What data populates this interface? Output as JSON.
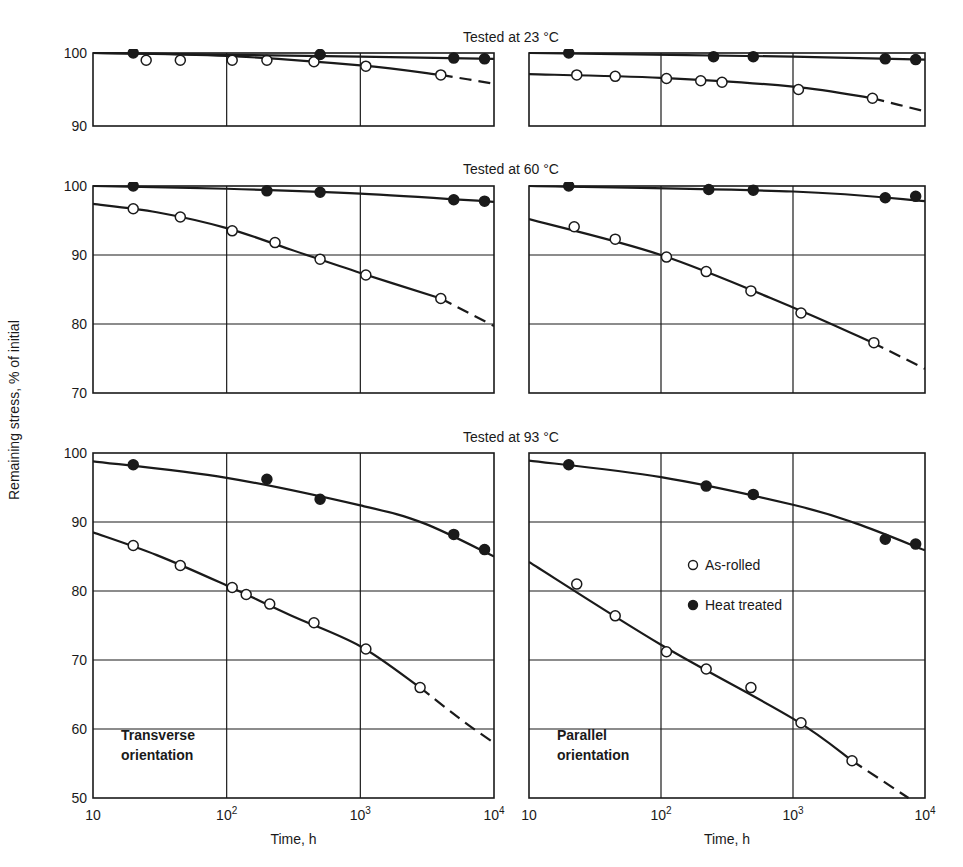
{
  "figure": {
    "y_axis_label": "Remaining stress, % of initial",
    "x_axis_label": "Time, h",
    "x_ticks": [
      "10",
      "10^2",
      "10^3",
      "10^4"
    ],
    "legend": [
      {
        "marker": "open-circle",
        "label": "As-rolled"
      },
      {
        "marker": "filled-circle",
        "label": "Heat treated"
      }
    ],
    "column_labels": [
      "Transverse\norientation",
      "Parallel\norientation"
    ]
  },
  "chart_data": [
    {
      "type": "line",
      "title": "Tested at 23 °C",
      "xlabel": "Time, h",
      "ylabel": "Remaining stress, % of initial",
      "xscale": "log",
      "xlim": [
        10,
        10000
      ],
      "ylim": [
        90,
        100
      ],
      "yticks": [
        90,
        100
      ],
      "panels": [
        {
          "orientation": "Transverse",
          "series": [
            {
              "name": "As-rolled",
              "x": [
                25,
                45,
                110,
                200,
                450,
                1100,
                4000
              ],
              "y": [
                99.0,
                99.0,
                99.0,
                99.0,
                98.8,
                98.2,
                97.0
              ],
              "curve": [
                [
                  10,
                  100
                ],
                [
                  100,
                  99.6
                ],
                [
                  1000,
                  98.3
                ],
                [
                  4000,
                  97.0
                ]
              ],
              "dashed_to": [
                [
                  4000,
                  97.0
                ],
                [
                  10000,
                  95.8
                ]
              ]
            },
            {
              "name": "Heat treated",
              "x": [
                20,
                500,
                5000,
                8500
              ],
              "y": [
                100.0,
                99.8,
                99.3,
                99.2
              ],
              "curve": [
                [
                  10,
                  100
                ],
                [
                  1000,
                  99.5
                ],
                [
                  10000,
                  99.2
                ]
              ]
            }
          ]
        },
        {
          "orientation": "Parallel",
          "series": [
            {
              "name": "As-rolled",
              "x": [
                23,
                45,
                110,
                200,
                290,
                1100,
                4000
              ],
              "y": [
                97.0,
                96.8,
                96.5,
                96.2,
                96.0,
                95.0,
                93.8
              ],
              "curve": [
                [
                  10,
                  97.1
                ],
                [
                  100,
                  96.6
                ],
                [
                  1000,
                  95.4
                ],
                [
                  4000,
                  93.8
                ]
              ],
              "dashed_to": [
                [
                  4000,
                  93.8
                ],
                [
                  10000,
                  92.0
                ]
              ]
            },
            {
              "name": "Heat treated",
              "x": [
                20,
                250,
                500,
                5000,
                8500
              ],
              "y": [
                100.0,
                99.5,
                99.5,
                99.2,
                99.1
              ],
              "curve": [
                [
                  10,
                  100
                ],
                [
                  1000,
                  99.5
                ],
                [
                  10000,
                  99.1
                ]
              ]
            }
          ]
        }
      ]
    },
    {
      "type": "line",
      "title": "Tested at 60 °C",
      "xscale": "log",
      "xlim": [
        10,
        10000
      ],
      "ylim": [
        70,
        100
      ],
      "yticks": [
        70,
        80,
        90,
        100
      ],
      "panels": [
        {
          "orientation": "Transverse",
          "series": [
            {
              "name": "As-rolled",
              "x": [
                20,
                45,
                110,
                230,
                500,
                1100,
                4000
              ],
              "y": [
                96.7,
                95.5,
                93.5,
                91.8,
                89.4,
                87.1,
                83.7
              ],
              "curve": [
                [
                  10,
                  97.4
                ],
                [
                  30,
                  96.2
                ],
                [
                  100,
                  93.9
                ],
                [
                  300,
                  90.8
                ],
                [
                  1000,
                  87.4
                ],
                [
                  4000,
                  83.7
                ]
              ],
              "dashed_to": [
                [
                  4000,
                  83.7
                ],
                [
                  10000,
                  79.7
                ]
              ]
            },
            {
              "name": "Heat treated",
              "x": [
                20,
                200,
                500,
                5000,
                8500
              ],
              "y": [
                100.0,
                99.3,
                99.1,
                98.0,
                97.8
              ],
              "curve": [
                [
                  10,
                  100
                ],
                [
                  100,
                  99.6
                ],
                [
                  1000,
                  98.9
                ],
                [
                  10000,
                  97.7
                ]
              ]
            }
          ]
        },
        {
          "orientation": "Parallel",
          "series": [
            {
              "name": "As-rolled",
              "x": [
                22,
                45,
                110,
                220,
                480,
                1150,
                4100
              ],
              "y": [
                94.1,
                92.3,
                89.7,
                87.6,
                84.8,
                81.6,
                77.3
              ],
              "curve": [
                [
                  10,
                  95.2
                ],
                [
                  100,
                  90.0
                ],
                [
                  1000,
                  82.4
                ],
                [
                  4000,
                  77.3
                ]
              ],
              "dashed_to": [
                [
                  4000,
                  77.3
                ],
                [
                  10000,
                  73.5
                ]
              ]
            },
            {
              "name": "Heat treated",
              "x": [
                20,
                230,
                500,
                5000,
                8500
              ],
              "y": [
                100.0,
                99.5,
                99.4,
                98.3,
                98.5
              ],
              "curve": [
                [
                  10,
                  100
                ],
                [
                  1000,
                  99.2
                ],
                [
                  10000,
                  97.8
                ]
              ]
            }
          ]
        }
      ]
    },
    {
      "type": "line",
      "title": "Tested at 93 °C",
      "xscale": "log",
      "xlim": [
        10,
        10000
      ],
      "ylim": [
        50,
        100
      ],
      "yticks": [
        50,
        60,
        70,
        80,
        90,
        100
      ],
      "panels": [
        {
          "orientation": "Transverse",
          "series": [
            {
              "name": "As-rolled",
              "x": [
                20,
                45,
                110,
                140,
                210,
                450,
                1100,
                2800
              ],
              "y": [
                86.6,
                83.7,
                80.5,
                79.5,
                78.1,
                75.4,
                71.6,
                66.0
              ],
              "curve": [
                [
                  10,
                  88.5
                ],
                [
                  30,
                  85.2
                ],
                [
                  100,
                  80.8
                ],
                [
                  300,
                  76.5
                ],
                [
                  1000,
                  72.0
                ],
                [
                  2800,
                  66.0
                ]
              ],
              "dashed_to": [
                [
                  2800,
                  66.0
                ],
                [
                  6000,
                  61.0
                ],
                [
                  10000,
                  58.0
                ]
              ]
            },
            {
              "name": "Heat treated",
              "x": [
                20,
                200,
                500,
                5000,
                8500
              ],
              "y": [
                98.3,
                96.2,
                93.3,
                88.2,
                86.0
              ],
              "curve": [
                [
                  10,
                  98.8
                ],
                [
                  100,
                  96.4
                ],
                [
                  1000,
                  92.4
                ],
                [
                  3000,
                  89.8
                ],
                [
                  10000,
                  85.0
                ]
              ]
            }
          ]
        },
        {
          "orientation": "Parallel",
          "series": [
            {
              "name": "As-rolled",
              "x": [
                23,
                45,
                110,
                220,
                480,
                1150,
                2800
              ],
              "y": [
                81.0,
                76.4,
                71.2,
                68.7,
                66.0,
                60.9,
                55.4
              ],
              "curve": [
                [
                  10,
                  84.2
                ],
                [
                  100,
                  72.2
                ],
                [
                  1000,
                  61.5
                ],
                [
                  2800,
                  55.4
                ]
              ],
              "dashed_to": [
                [
                  2800,
                  55.4
                ],
                [
                  7500,
                  50.0
                ]
              ]
            },
            {
              "name": "Heat treated",
              "x": [
                20,
                220,
                500,
                5000,
                8500
              ],
              "y": [
                98.3,
                95.2,
                94.0,
                87.5,
                86.8
              ],
              "curve": [
                [
                  10,
                  98.9
                ],
                [
                  100,
                  96.5
                ],
                [
                  1000,
                  92.5
                ],
                [
                  3000,
                  89.8
                ],
                [
                  10000,
                  85.9
                ]
              ]
            }
          ]
        }
      ]
    }
  ]
}
